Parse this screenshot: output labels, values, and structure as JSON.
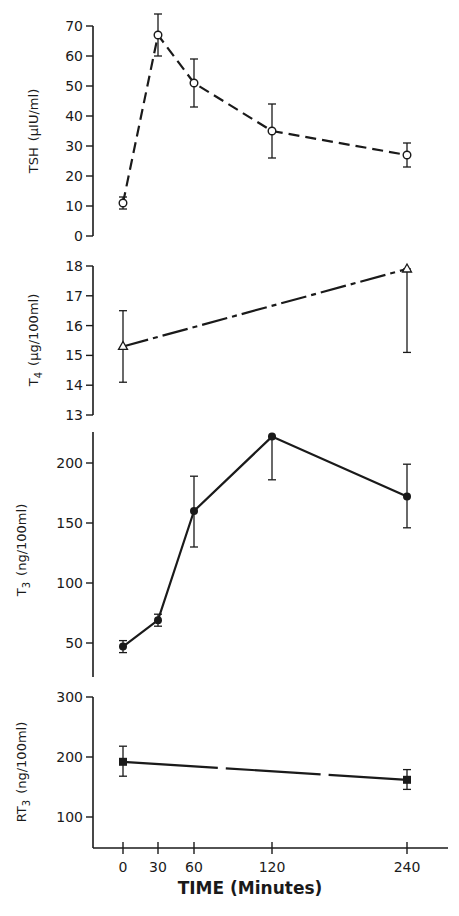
{
  "chart_data": [
    {
      "type": "line",
      "panel": "TSH",
      "ylabel": "TSH (μIU/ml)",
      "x": [
        0,
        30,
        60,
        120,
        240
      ],
      "values": [
        11,
        67,
        51,
        35,
        27
      ],
      "error_upper": [
        13,
        74,
        59,
        44,
        31
      ],
      "error_lower": [
        9,
        60,
        43,
        26,
        23
      ],
      "marker": "open-circle",
      "line_style": "dashed",
      "yticks": [
        0,
        10,
        20,
        30,
        40,
        50,
        60,
        70
      ],
      "ylim": [
        0,
        70
      ],
      "grid": false
    },
    {
      "type": "line",
      "panel": "T4",
      "ylabel": "T4 (μg/100ml)",
      "x": [
        0,
        240
      ],
      "values": [
        15.3,
        17.9
      ],
      "error_upper": [
        16.5,
        17.9
      ],
      "error_lower": [
        14.1,
        15.1
      ],
      "marker": "open-triangle",
      "line_style": "dash-dot",
      "yticks": [
        13,
        14,
        15,
        16,
        17,
        18
      ],
      "ylim": [
        13,
        18
      ],
      "grid": false
    },
    {
      "type": "line",
      "panel": "T3",
      "ylabel": "T3 (ng/100ml)",
      "x": [
        0,
        30,
        60,
        120,
        240
      ],
      "values": [
        47,
        69,
        160,
        222,
        172
      ],
      "error_upper": [
        52,
        74,
        189,
        222,
        199
      ],
      "error_lower": [
        42,
        64,
        130,
        186,
        146
      ],
      "marker": "filled-circle",
      "line_style": "solid",
      "yticks": [
        50,
        100,
        150,
        200
      ],
      "ylim": [
        22,
        226
      ],
      "grid": false
    },
    {
      "type": "line",
      "panel": "RT3",
      "ylabel": "RT3 (ng/100ml)",
      "x": [
        0,
        240
      ],
      "values": [
        192,
        162
      ],
      "error_upper": [
        218,
        179
      ],
      "error_lower": [
        168,
        146
      ],
      "marker": "filled-square",
      "line_style": "long-dash",
      "yticks": [
        100,
        200,
        300
      ],
      "ylim": [
        48,
        300
      ],
      "grid": false
    }
  ],
  "xaxis": {
    "label": "TIME (Minutes)",
    "ticks": [
      0,
      30,
      60,
      120,
      240
    ],
    "tick_labels": [
      "0",
      "30",
      "60",
      "120",
      "240"
    ]
  },
  "labels": {
    "tsh_main": "TSH",
    "tsh_unit": "(μIU/ml)",
    "t4_main": "T",
    "t4_sub": "4",
    "t4_unit": "(μg/100ml)",
    "t3_main": "T",
    "t3_sub": "3",
    "t3_unit": "(ng/100ml)",
    "rt3_main": "RT",
    "rt3_sub": "3",
    "rt3_unit": "(ng/100ml)"
  },
  "colors": {
    "ink": "#1a1a1a",
    "background": "#ffffff"
  }
}
